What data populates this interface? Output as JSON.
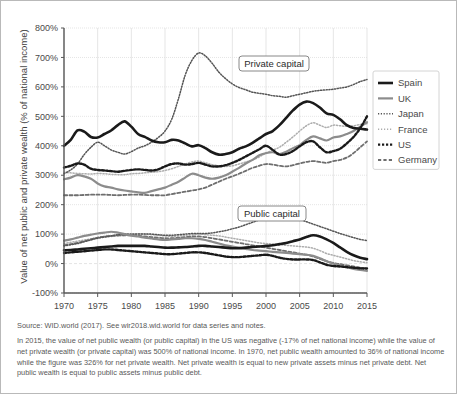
{
  "figure": {
    "ytitle": "Value of net public and private wealth (% of national income)",
    "source": "Source: WID.world (2017). See wir2018.wid.world for data series and notes.",
    "note": "In 2015, the value of net public wealth (or public capital) in the US was negative (-17% of net national income) while the value of net private wealth (or private capital) was 500% of national income. In 1970, net public wealth amounted to 36% of national income while the figure was 326% for net private wealth. Net private wealth is equal to new private assets minus net private debt. Net public wealth is equal to public assets minus public debt.",
    "annotations": [
      {
        "id": "private-capital",
        "label": "Private capital"
      },
      {
        "id": "public-capital",
        "label": "Public capital"
      }
    ]
  },
  "legend": {
    "position": "right",
    "items": [
      {
        "name": "Spain",
        "color": "#1a1a1a",
        "style": "solid",
        "width": 2.6
      },
      {
        "name": "UK",
        "color": "#8c8c8c",
        "style": "solid",
        "width": 2.2
      },
      {
        "name": "Japan",
        "color": "#555555",
        "style": "dotted-fine",
        "width": 1.5
      },
      {
        "name": "France",
        "color": "#adadad",
        "style": "dotted-light",
        "width": 1.5
      },
      {
        "name": "US",
        "color": "#1a1a1a",
        "style": "dotted-bold",
        "width": 2.4
      },
      {
        "name": "Germany",
        "color": "#6e6e6e",
        "style": "dashed",
        "width": 1.8
      }
    ]
  },
  "chart_data": {
    "type": "line",
    "title": "",
    "xlabel": "",
    "ylabel": "Value of net public and private wealth (% of national income)",
    "xlim": [
      1970,
      2015
    ],
    "ylim": [
      -100,
      800
    ],
    "ytick_labels": [
      "-100%",
      "0%",
      "100%",
      "200%",
      "300%",
      "400%",
      "500%",
      "600%",
      "700%",
      "800%"
    ],
    "ytick_values": [
      -100,
      0,
      100,
      200,
      300,
      400,
      500,
      600,
      700,
      800
    ],
    "xtick_labels": [
      "1970",
      "1975",
      "1980",
      "1985",
      "1990",
      "1995",
      "2000",
      "2005",
      "2010",
      "2015"
    ],
    "xtick_values": [
      1970,
      1975,
      1980,
      1985,
      1990,
      1995,
      2000,
      2005,
      2010,
      2015
    ],
    "grid": true,
    "legend_position": "right",
    "x": [
      1970,
      1971,
      1972,
      1973,
      1974,
      1975,
      1976,
      1977,
      1978,
      1979,
      1980,
      1981,
      1982,
      1983,
      1984,
      1985,
      1986,
      1987,
      1988,
      1989,
      1990,
      1991,
      1992,
      1993,
      1994,
      1995,
      1996,
      1997,
      1998,
      1999,
      2000,
      2001,
      2002,
      2003,
      2004,
      2005,
      2006,
      2007,
      2008,
      2009,
      2010,
      2011,
      2012,
      2013,
      2014,
      2015
    ],
    "groups": [
      {
        "group": "Private capital",
        "series": [
          {
            "name": "Spain",
            "values": [
              400,
              420,
              452,
              448,
              430,
              428,
              440,
              452,
              470,
              483,
              465,
              440,
              430,
              418,
              412,
              412,
              420,
              418,
              408,
              398,
              402,
              392,
              378,
              370,
              372,
              378,
              390,
              398,
              410,
              425,
              440,
              450,
              470,
              495,
              520,
              540,
              550,
              545,
              530,
              510,
              505,
              490,
              470,
              460,
              458,
              455
            ]
          },
          {
            "name": "UK",
            "values": [
              286,
              292,
              300,
              296,
              288,
              272,
              262,
              258,
              252,
              248,
              245,
              242,
              240,
              246,
              252,
              258,
              268,
              278,
              292,
              305,
              300,
              292,
              288,
              292,
              300,
              312,
              325,
              340,
              352,
              368,
              375,
              378,
              372,
              380,
              392,
              402,
              420,
              432,
              425,
              418,
              428,
              432,
              440,
              450,
              465,
              480
            ]
          },
          {
            "name": "Japan",
            "values": [
              305,
              318,
              338,
              370,
              395,
              412,
              400,
              386,
              378,
              372,
              380,
              392,
              400,
              412,
              428,
              450,
              490,
              560,
              640,
              690,
              715,
              705,
              680,
              650,
              628,
              610,
              598,
              590,
              582,
              578,
              575,
              570,
              568,
              565,
              570,
              575,
              580,
              585,
              588,
              590,
              592,
              596,
              600,
              608,
              618,
              625
            ]
          },
          {
            "name": "France",
            "values": [
              310,
              308,
              306,
              305,
              304,
              306,
              305,
              303,
              302,
              302,
              305,
              306,
              308,
              310,
              312,
              316,
              322,
              330,
              338,
              345,
              348,
              342,
              336,
              332,
              330,
              332,
              338,
              345,
              352,
              362,
              375,
              385,
              395,
              412,
              430,
              450,
              468,
              478,
              470,
              462,
              470,
              468,
              466,
              468,
              472,
              475
            ]
          },
          {
            "name": "US",
            "values": [
              326,
              332,
              340,
              336,
              322,
              318,
              316,
              314,
              312,
              315,
              318,
              320,
              318,
              316,
              320,
              330,
              338,
              340,
              336,
              338,
              342,
              336,
              330,
              330,
              334,
              342,
              352,
              364,
              376,
              388,
              400,
              386,
              370,
              372,
              382,
              398,
              412,
              415,
              395,
              378,
              382,
              390,
              408,
              430,
              460,
              500
            ]
          },
          {
            "name": "Germany",
            "values": [
              232,
              232,
              232,
              233,
              234,
              234,
              234,
              233,
              232,
              233,
              234,
              234,
              233,
              232,
              232,
              232,
              236,
              240,
              244,
              248,
              252,
              258,
              268,
              278,
              288,
              296,
              305,
              315,
              325,
              332,
              338,
              336,
              332,
              330,
              334,
              340,
              345,
              348,
              345,
              342,
              348,
              352,
              360,
              375,
              395,
              415
            ]
          }
        ]
      },
      {
        "group": "Public capital",
        "series": [
          {
            "name": "Spain",
            "values": [
              45,
              46,
              48,
              50,
              52,
              54,
              56,
              58,
              60,
              60,
              60,
              60,
              60,
              58,
              56,
              54,
              54,
              55,
              56,
              58,
              60,
              60,
              58,
              56,
              54,
              52,
              52,
              54,
              56,
              58,
              60,
              62,
              66,
              70,
              76,
              82,
              90,
              96,
              92,
              82,
              70,
              55,
              40,
              28,
              20,
              15
            ]
          },
          {
            "name": "UK",
            "values": [
              78,
              82,
              88,
              94,
              98,
              102,
              105,
              108,
              105,
              100,
              95,
              92,
              88,
              85,
              82,
              80,
              82,
              84,
              86,
              86,
              84,
              80,
              74,
              68,
              62,
              58,
              54,
              50,
              46,
              44,
              42,
              40,
              38,
              36,
              34,
              32,
              30,
              26,
              18,
              8,
              0,
              -6,
              -12,
              -18,
              -22,
              -25
            ]
          },
          {
            "name": "Japan",
            "values": [
              60,
              64,
              68,
              74,
              80,
              86,
              90,
              94,
              98,
              100,
              100,
              100,
              100,
              100,
              98,
              96,
              96,
              98,
              100,
              102,
              102,
              102,
              104,
              108,
              112,
              118,
              124,
              132,
              140,
              148,
              154,
              158,
              160,
              158,
              154,
              150,
              142,
              134,
              126,
              118,
              110,
              102,
              95,
              88,
              82,
              78
            ]
          },
          {
            "name": "France",
            "values": [
              68,
              72,
              76,
              80,
              84,
              88,
              90,
              92,
              94,
              96,
              98,
              100,
              100,
              98,
              96,
              94,
              92,
              94,
              96,
              98,
              100,
              98,
              96,
              94,
              90,
              86,
              82,
              78,
              74,
              70,
              68,
              66,
              64,
              62,
              60,
              58,
              56,
              52,
              44,
              34,
              28,
              22,
              16,
              10,
              6,
              3
            ]
          },
          {
            "name": "US",
            "values": [
              36,
              38,
              40,
              42,
              44,
              46,
              48,
              48,
              46,
              44,
              42,
              40,
              38,
              36,
              34,
              32,
              32,
              34,
              36,
              38,
              38,
              36,
              32,
              28,
              24,
              22,
              22,
              24,
              26,
              28,
              30,
              26,
              20,
              16,
              14,
              14,
              14,
              12,
              4,
              -4,
              -8,
              -10,
              -12,
              -14,
              -16,
              -17
            ]
          },
          {
            "name": "Germany",
            "values": [
              62,
              66,
              70,
              76,
              82,
              88,
              92,
              94,
              96,
              96,
              96,
              94,
              92,
              90,
              88,
              86,
              86,
              88,
              90,
              92,
              92,
              90,
              86,
              82,
              78,
              74,
              70,
              66,
              62,
              58,
              54,
              50,
              46,
              42,
              38,
              34,
              30,
              24,
              16,
              8,
              2,
              -2,
              -6,
              -10,
              -14,
              -16
            ]
          }
        ]
      }
    ]
  }
}
